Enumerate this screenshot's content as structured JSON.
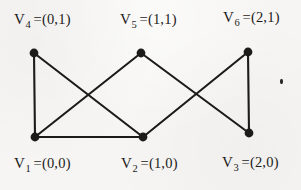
{
  "figure": {
    "type": "undirected-graph-diagram",
    "background_color": "#f6f5f3",
    "ink_color": "#1c1b1a",
    "width": 301,
    "height": 190
  },
  "vertices": [
    {
      "id": "v1",
      "name": "V",
      "subscript": "1",
      "coord": "=(0,0)",
      "x": 35,
      "y": 137,
      "row": "bottom"
    },
    {
      "id": "v2",
      "name": "V",
      "subscript": "2",
      "coord": "=(1,0)",
      "x": 143,
      "y": 137,
      "row": "bottom"
    },
    {
      "id": "v3",
      "name": "V",
      "subscript": "3",
      "coord": "=(2,0)",
      "x": 249,
      "y": 133,
      "row": "bottom"
    },
    {
      "id": "v4",
      "name": "V",
      "subscript": "4",
      "coord": "=(0,1)",
      "x": 34,
      "y": 53,
      "row": "top"
    },
    {
      "id": "v5",
      "name": "V",
      "subscript": "5",
      "coord": "=(1,1)",
      "x": 141,
      "y": 53,
      "row": "top"
    },
    {
      "id": "v6",
      "name": "V",
      "subscript": "6",
      "coord": "=(2,1)",
      "x": 248,
      "y": 52,
      "row": "top"
    }
  ],
  "edges": [
    {
      "id": "e-v4-v1",
      "from": "v4",
      "to": "v1"
    },
    {
      "id": "e-v4-v2",
      "from": "v4",
      "to": "v2"
    },
    {
      "id": "e-v5-v1",
      "from": "v5",
      "to": "v1"
    },
    {
      "id": "e-v5-v3",
      "from": "v5",
      "to": "v3"
    },
    {
      "id": "e-v6-v2",
      "from": "v6",
      "to": "v2"
    },
    {
      "id": "e-v6-v3",
      "from": "v6",
      "to": "v3"
    },
    {
      "id": "e-v1-v2",
      "from": "v1",
      "to": "v2"
    }
  ],
  "artifacts": [
    {
      "id": "speck",
      "kind": "scan-speck",
      "x": 281,
      "y": 82
    }
  ]
}
